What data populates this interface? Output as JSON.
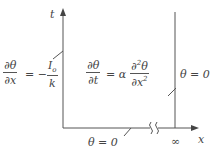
{
  "diagram": {
    "axes": {
      "vertical_label": "t",
      "horizontal_label": "x",
      "infinity_label": "∞"
    },
    "left_boundary_condition": {
      "lhs_num": "∂θ",
      "lhs_den": "∂x",
      "equals": "= −",
      "rhs_num": "I",
      "rhs_num_sub": "o",
      "rhs_den": "k"
    },
    "governing_equation": {
      "lhs_num": "∂θ",
      "lhs_den": "∂t",
      "middle": "= α",
      "rhs_num": "∂",
      "rhs_num_sup": "2",
      "rhs_num_tail": "θ",
      "rhs_den": "∂x",
      "rhs_den_sup": "2"
    },
    "right_boundary_condition": "θ = 0",
    "initial_condition": "θ = 0",
    "colors": {
      "line": "#555555",
      "text": "#444444",
      "background": "#ffffff"
    }
  }
}
